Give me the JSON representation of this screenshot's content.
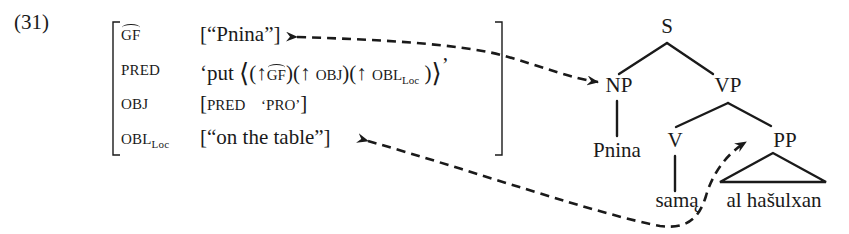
{
  "example_number": "(31)",
  "f_structure": {
    "rows": [
      {
        "attr": "GF",
        "attr_hat": true,
        "value_open": "[",
        "value": "“Pnina”",
        "value_close": "]"
      },
      {
        "attr": "PRED",
        "value_prefix": "‘put ",
        "value_args": [
          "(↑ GF)",
          "(↑ OBJ)",
          "(↑ OBL",
          "Loc",
          ")"
        ],
        "value_suffix": "’"
      },
      {
        "attr": "OBJ",
        "value_open": "[",
        "value": "PRED   ‘PRO’",
        "value_close": "]"
      },
      {
        "attr": "OBL",
        "attr_sub": "Loc",
        "value_open": "[",
        "value": "“on the table”",
        "value_close": "]"
      }
    ],
    "pred_parts": {
      "quote_open": "‘put",
      "angle_open": "⟨",
      "arg1_open": "(↑",
      "arg1_name": "GF",
      "arg1_close": ")",
      "arg2": "(↑ OBJ)",
      "arg3_open": "(↑ OBL",
      "arg3_sub": "Loc",
      "arg3_close": ")",
      "angle_close": "⟩",
      "quote_close": "’"
    },
    "obj_parts": {
      "pred": "PRED",
      "value": "‘PRO’"
    }
  },
  "tree": {
    "nodes": [
      {
        "id": "S",
        "label": "S"
      },
      {
        "id": "NP",
        "label": "NP"
      },
      {
        "id": "VP",
        "label": "VP"
      },
      {
        "id": "V",
        "label": "V"
      },
      {
        "id": "PP",
        "label": "PP"
      },
      {
        "id": "Pnina",
        "label": "Pnina"
      },
      {
        "id": "sama",
        "label": "samą"
      },
      {
        "id": "al_hasulxan",
        "label": "al hašulxan"
      }
    ],
    "edges": [
      [
        "S",
        "NP"
      ],
      [
        "S",
        "VP"
      ],
      [
        "NP",
        "Pnina"
      ],
      [
        "VP",
        "V"
      ],
      [
        "VP",
        "PP"
      ],
      [
        "V",
        "sama"
      ]
    ],
    "triangle": {
      "parent": "PP",
      "yield": "al hašulxan"
    }
  },
  "links": [
    {
      "from": "NP",
      "to": "GF value “Pnina”",
      "style": "dashed",
      "arrowheads": "both"
    },
    {
      "from": "PP",
      "to": "OBL value “on the table”",
      "style": "dashed",
      "arrowheads": "both"
    }
  ],
  "colors": {
    "ink": "#1a1a1a",
    "background": "#ffffff"
  }
}
